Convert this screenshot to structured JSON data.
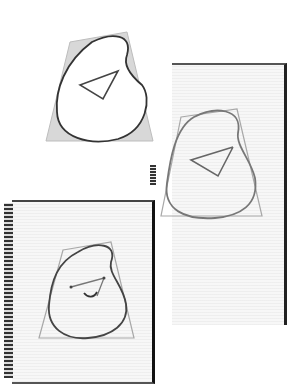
{
  "figure": {
    "panels": [
      {
        "id": "sketch-1",
        "stage": "shaded trapezoid with bean outline and triangle"
      },
      {
        "id": "sketch-2",
        "stage": "trapezoid outline with bean shape and open triangle"
      },
      {
        "id": "sketch-3",
        "stage": "spiral notebook page with bean shape, triangle and curve"
      }
    ]
  },
  "colors": {
    "paper": "#f7f7f7",
    "shade": "#d6d6d6",
    "stroke": "#3a3a3a",
    "guide": "#9a9a9a"
  }
}
